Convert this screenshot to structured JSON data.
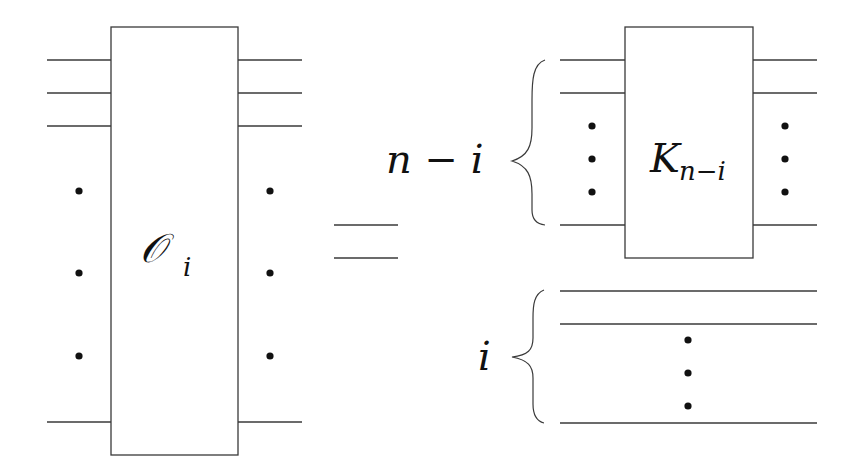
{
  "diagram": {
    "type": "quantum-circuit-identity",
    "equals_symbol": "=",
    "left_side": {
      "gate_label": "𝒪",
      "gate_subscript": "i",
      "wire_ellipsis": "vertical-dots"
    },
    "right_side": {
      "top_group": {
        "brace_label": "n − i",
        "gate_label": "K",
        "gate_subscript": "n−i"
      },
      "bottom_group": {
        "brace_label": "i",
        "gate": null
      }
    }
  }
}
